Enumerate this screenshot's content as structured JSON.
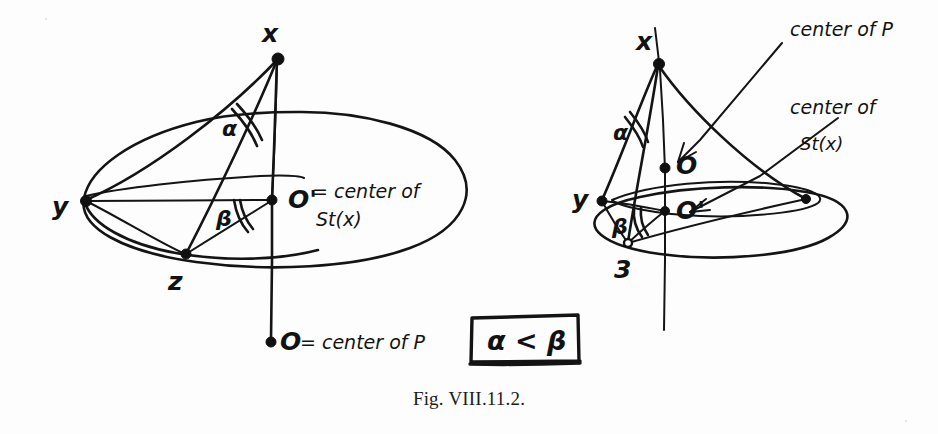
{
  "figure": {
    "caption": "Fig. VIII.11.2.",
    "type": "hand-drawn-geometry-diagram",
    "ink_color": "#141414",
    "background_color": "#fdfdfd"
  },
  "left_diagram": {
    "name": "flat-star-configuration",
    "apex_label": "x",
    "vertex_labels": [
      "y",
      "z"
    ],
    "center_label": "O'",
    "center_note_line1": "= center of",
    "center_note_line2": "St(x)",
    "angle_top_label": "α",
    "angle_base_label": "β",
    "axis_bottom_label": "O",
    "axis_bottom_note": "= center of P"
  },
  "right_diagram": {
    "name": "cone-star-configuration",
    "apex_label": "x",
    "vertex_labels": [
      "y",
      "3"
    ],
    "center_upper_label": "O",
    "center_lower_label": "O'",
    "angle_top_label": "α",
    "angle_base_label": "β",
    "annotation_upper": "center of P",
    "annotation_lower_line1": "center of",
    "annotation_lower_line2": "St(x)"
  },
  "boxed_relation": {
    "text": "α < β"
  }
}
